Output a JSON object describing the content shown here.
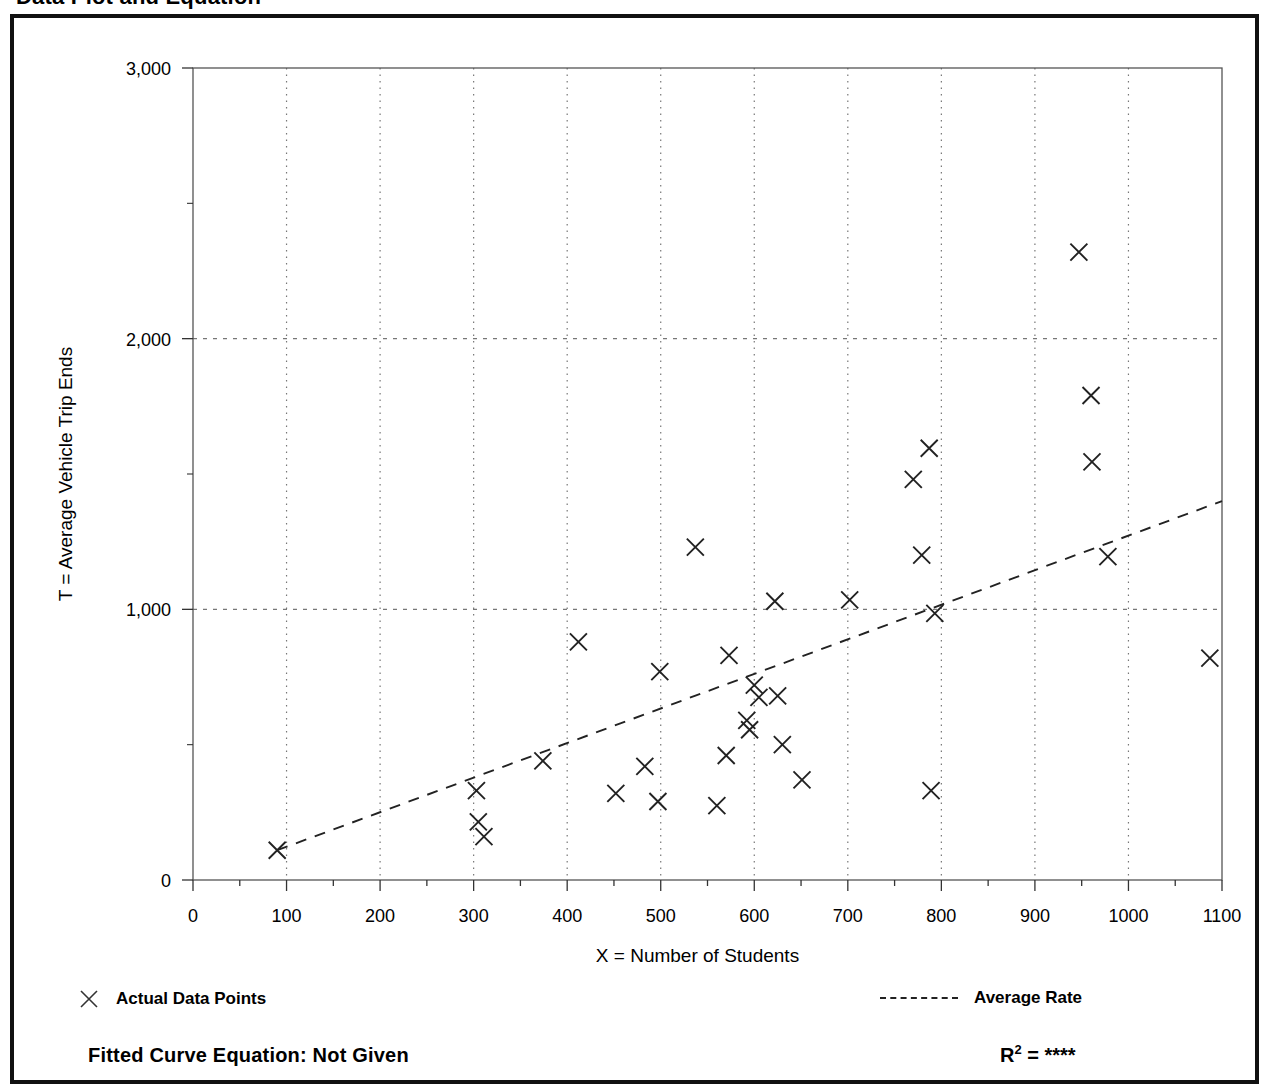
{
  "document": {
    "title": "Data Plot and Equation"
  },
  "legend": {
    "data_points_label": "Actual Data Points",
    "data_points_icon": "x-marker-icon",
    "average_rate_label": "Average Rate",
    "average_rate_icon": "dashed-line-icon"
  },
  "footer": {
    "equation_label": "Fitted Curve Equation:  Not Given",
    "r_squared_prefix": "R",
    "r_squared_exponent": "2",
    "r_squared_value": "= ****"
  },
  "colors": {
    "frame": "#111111",
    "axis": "#555555",
    "grid": "#777777",
    "marker": "#222222",
    "trend": "#222222"
  },
  "chart_data": {
    "type": "scatter",
    "title": "Data Plot and Equation",
    "xlabel": "X = Number of Students",
    "ylabel": "T = Average Vehicle Trip Ends",
    "xlim": [
      0,
      1100
    ],
    "ylim": [
      0,
      3000
    ],
    "xticks": [
      0,
      100,
      200,
      300,
      400,
      500,
      600,
      700,
      800,
      900,
      1000,
      1100
    ],
    "xtick_labels": [
      "0",
      "100",
      "200",
      "300",
      "400",
      "500",
      "600",
      "700",
      "800",
      "900",
      "1000",
      "1100"
    ],
    "yticks": [
      0,
      1000,
      2000,
      3000
    ],
    "ytick_labels": [
      "0",
      "1,000",
      "2,000",
      "3,000"
    ],
    "x_minor_tick_interval": 50,
    "grid": {
      "vertical_at": [
        100,
        200,
        300,
        400,
        500,
        600,
        700,
        800,
        900,
        1000
      ],
      "horizontal_at": [
        1000,
        2000
      ],
      "style": "dotted"
    },
    "legend_position": "below-plot",
    "series": [
      {
        "name": "Actual Data Points",
        "marker": "x",
        "points": [
          [
            90,
            110
          ],
          [
            303,
            330
          ],
          [
            305,
            215
          ],
          [
            311,
            160
          ],
          [
            374,
            440
          ],
          [
            412,
            880
          ],
          [
            452,
            320
          ],
          [
            483,
            420
          ],
          [
            497,
            290
          ],
          [
            499,
            770
          ],
          [
            537,
            1230
          ],
          [
            560,
            275
          ],
          [
            570,
            460
          ],
          [
            573,
            830
          ],
          [
            592,
            590
          ],
          [
            595,
            555
          ],
          [
            600,
            720
          ],
          [
            605,
            675
          ],
          [
            622,
            1030
          ],
          [
            625,
            680
          ],
          [
            630,
            500
          ],
          [
            651,
            370
          ],
          [
            702,
            1035
          ],
          [
            770,
            1480
          ],
          [
            779,
            1200
          ],
          [
            787,
            1595
          ],
          [
            789,
            330
          ],
          [
            793,
            985
          ],
          [
            947,
            2320
          ],
          [
            960,
            1790
          ],
          [
            961,
            1545
          ],
          [
            978,
            1195
          ],
          [
            1087,
            820
          ]
        ]
      }
    ],
    "trend_line": {
      "name": "Average Rate",
      "style": "dashed",
      "endpoints": [
        [
          90,
          110
        ],
        [
          1100,
          1400
        ]
      ]
    }
  }
}
